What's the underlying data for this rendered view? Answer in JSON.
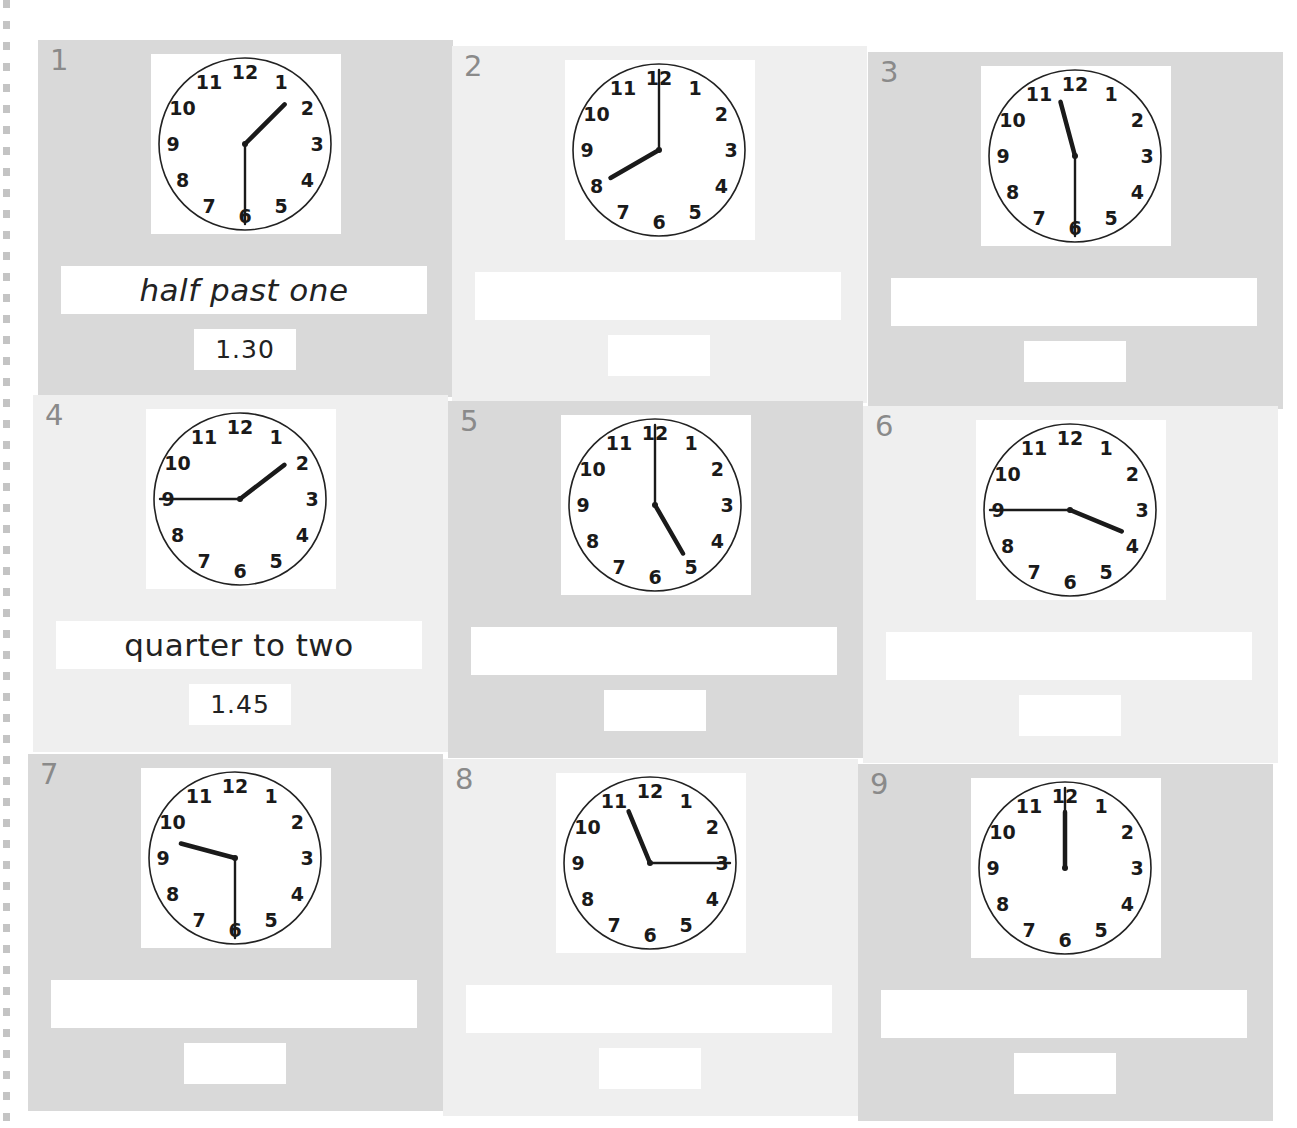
{
  "worksheet": {
    "cells": [
      {
        "number": "1",
        "shade": "dark",
        "x": 38,
        "y": 40,
        "hour": 1,
        "minute": 30,
        "words": "half past one",
        "digits": "1.30"
      },
      {
        "number": "2",
        "shade": "light",
        "x": 452,
        "y": 46,
        "hour": 8,
        "minute": 0,
        "words": "",
        "digits": ""
      },
      {
        "number": "3",
        "shade": "dark",
        "x": 868,
        "y": 52,
        "hour": 11,
        "minute": 30,
        "words": "",
        "digits": ""
      },
      {
        "number": "4",
        "shade": "light",
        "x": 33,
        "y": 395,
        "hour": 1,
        "minute": 45,
        "words": "quarter to two",
        "digits": "1.45"
      },
      {
        "number": "5",
        "shade": "dark",
        "x": 448,
        "y": 401,
        "hour": 5,
        "minute": 0,
        "words": "",
        "digits": ""
      },
      {
        "number": "6",
        "shade": "light",
        "x": 863,
        "y": 406,
        "hour": 3,
        "minute": 45,
        "words": "",
        "digits": ""
      },
      {
        "number": "7",
        "shade": "dark",
        "x": 28,
        "y": 754,
        "hour": 9,
        "minute": 30,
        "words": "",
        "digits": ""
      },
      {
        "number": "8",
        "shade": "light",
        "x": 443,
        "y": 759,
        "hour": 11,
        "minute": 15,
        "words": "",
        "digits": ""
      },
      {
        "number": "9",
        "shade": "dark",
        "x": 858,
        "y": 764,
        "hour": 12,
        "minute": 0,
        "words": "",
        "digits": ""
      }
    ],
    "clock_numerals": [
      "12",
      "1",
      "2",
      "3",
      "4",
      "5",
      "6",
      "7",
      "8",
      "9",
      "10",
      "11"
    ],
    "colors": {
      "dark_cell": "#d9d9d9",
      "light_cell": "#efefef",
      "answer_box": "#ffffff",
      "clock_ink": "#1a1a1a",
      "cell_number": "#8a8a8a"
    }
  }
}
